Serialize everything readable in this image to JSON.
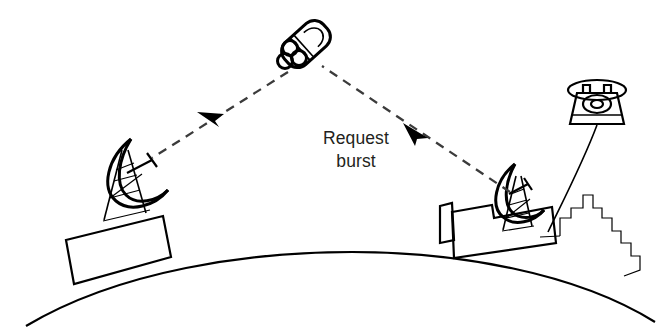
{
  "figure": {
    "type": "schematic-diagram",
    "background_color": "#ffffff",
    "ink_color": "#000000",
    "text_color": "#231f20",
    "width": 668,
    "height": 332
  },
  "labels": {
    "request_burst_line1": "Request",
    "request_burst_line2": "burst"
  },
  "elements": {
    "satellite": {
      "name": "satellite",
      "description": "cylindrical spacecraft with three circular nozzles",
      "nozzle_count": 3
    },
    "left_station": {
      "name": "left-ground-station",
      "description": "parabolic dish antenna on lattice tower atop building"
    },
    "right_station": {
      "name": "right-ground-station",
      "description": "parabolic dish antenna on lattice tower atop building"
    },
    "telephone": {
      "name": "telephone",
      "description": "rotary desk telephone connected by line to ground station"
    },
    "earth": {
      "name": "earth-surface",
      "description": "curved horizon arc"
    },
    "city": {
      "name": "city-skyline",
      "description": "stepped building silhouette at right"
    }
  },
  "links": [
    {
      "name": "downlink-to-left-station",
      "style": "dashed",
      "from": "satellite",
      "to": "left-ground-station",
      "arrow_direction": "toward-left-station"
    },
    {
      "name": "uplink-from-right-station",
      "style": "dashed",
      "from": "right-ground-station",
      "to": "satellite",
      "arrow_direction": "toward-satellite"
    }
  ],
  "colors": {
    "ink": "#000000",
    "text": "#231f20",
    "background": "#ffffff"
  }
}
